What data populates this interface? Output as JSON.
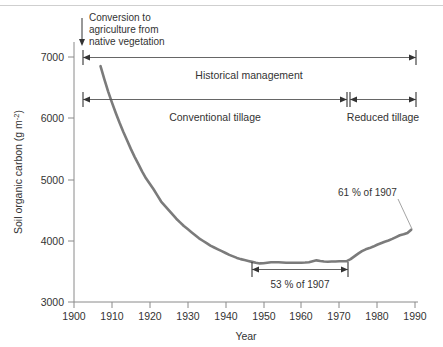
{
  "figure": {
    "background_color": "#ffffff",
    "curve_color": "#7b7b7b",
    "axis_color": "#8a8a8a",
    "text_color": "#333333"
  },
  "chart_data": {
    "type": "line",
    "title": "",
    "subtitle": "",
    "xlabel": "Year",
    "ylabel": "Soil organic carbon (g m-2)",
    "ylabel_display": "Soil organic carbon (g m",
    "ylabel_sup": "-2",
    "ylabel_tail": ")",
    "xlim": [
      1900,
      1990
    ],
    "ylim": [
      3000,
      7000
    ],
    "grid": false,
    "legend": "none",
    "xticks": [
      1900,
      1910,
      1920,
      1930,
      1940,
      1950,
      1960,
      1970,
      1980,
      1990
    ],
    "xticklabels": [
      "1900",
      "1910",
      "1920",
      "1930",
      "1940",
      "1950",
      "1960",
      "1970",
      "1980",
      "1990"
    ],
    "yticks": [
      3000,
      4000,
      5000,
      6000,
      7000
    ],
    "yticklabels": [
      "3000",
      "4000",
      "5000",
      "6000",
      "7000"
    ],
    "series": [
      {
        "name": "Soil organic carbon",
        "color": "#7b7b7b",
        "x": [
          1907,
          1908,
          1909,
          1910,
          1911,
          1912,
          1913,
          1914,
          1915,
          1916,
          1917,
          1918,
          1919,
          1920,
          1921,
          1922,
          1923,
          1924,
          1925,
          1926,
          1927,
          1928,
          1929,
          1930,
          1931,
          1932,
          1933,
          1934,
          1935,
          1936,
          1937,
          1938,
          1939,
          1940,
          1941,
          1942,
          1943,
          1944,
          1945,
          1946,
          1947,
          1948,
          1949,
          1950,
          1951,
          1952,
          1953,
          1954,
          1955,
          1956,
          1957,
          1958,
          1959,
          1960,
          1961,
          1962,
          1963,
          1964,
          1965,
          1966,
          1967,
          1968,
          1969,
          1970,
          1971,
          1972,
          1973,
          1974,
          1975,
          1976,
          1977,
          1978,
          1979,
          1980,
          1981,
          1982,
          1983,
          1984,
          1985,
          1986,
          1987,
          1988,
          1989
        ],
        "y": [
          6850,
          6640,
          6440,
          6260,
          6090,
          5930,
          5780,
          5640,
          5500,
          5370,
          5250,
          5130,
          5020,
          4930,
          4840,
          4740,
          4640,
          4570,
          4500,
          4430,
          4360,
          4300,
          4240,
          4190,
          4140,
          4090,
          4040,
          4000,
          3960,
          3920,
          3890,
          3860,
          3830,
          3800,
          3770,
          3745,
          3720,
          3700,
          3685,
          3670,
          3655,
          3640,
          3630,
          3632,
          3640,
          3648,
          3650,
          3648,
          3645,
          3642,
          3640,
          3640,
          3640,
          3642,
          3645,
          3650,
          3665,
          3680,
          3668,
          3660,
          3658,
          3660,
          3662,
          3665,
          3665,
          3668,
          3700,
          3745,
          3790,
          3830,
          3860,
          3880,
          3905,
          3935,
          3960,
          3985,
          4005,
          4030,
          4060,
          4090,
          4105,
          4125,
          4180
        ]
      }
    ],
    "annotations": [
      {
        "name": "conversion-note",
        "lines": [
          "Conversion to",
          "agriculture from",
          "native vegetation"
        ],
        "arrow": "down",
        "at_year": 1907
      },
      {
        "name": "historical-management-bracket",
        "label": "Historical management",
        "from_year": 1907,
        "to_year": 1990,
        "at_value": 7000
      },
      {
        "name": "conventional-tillage-bracket",
        "label": "Conventional tillage",
        "from_year": 1907,
        "to_year": 1972,
        "at_value": 6320
      },
      {
        "name": "reduced-tillage-bracket",
        "label": "Reduced tillage",
        "from_year": 1972,
        "to_year": 1990,
        "at_value": 6320
      },
      {
        "name": "minimum-percent-bracket",
        "label": "53 % of 1907",
        "from_year": 1947,
        "to_year": 1972,
        "at_value": 3470
      },
      {
        "name": "final-percent-callout",
        "label": "61 % of 1907",
        "at_year": 1989,
        "at_value": 4180
      }
    ]
  }
}
